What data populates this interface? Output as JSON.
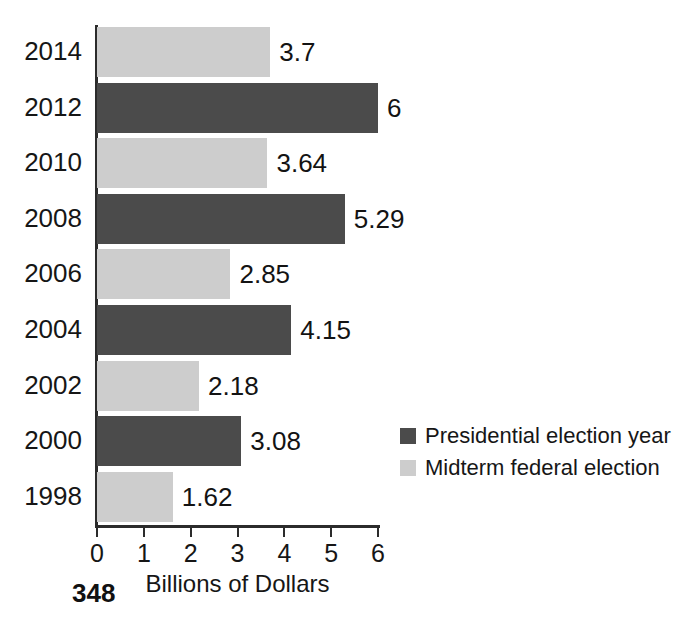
{
  "page": {
    "page_number": "348",
    "background_color": "#ffffff"
  },
  "colors": {
    "presidential": "#4b4b4b",
    "midterm": "#cdcdcd",
    "axis": "#2b2b2b",
    "text": "#161616"
  },
  "legend": {
    "position": "right-middle",
    "entries": [
      {
        "label": "Presidential election year",
        "color": "#4b4b4b",
        "swatch": "presidential"
      },
      {
        "label": "Midterm federal election",
        "color": "#cdcdcd",
        "swatch": "midterm"
      }
    ]
  },
  "axis": {
    "x_title": "Billions of Dollars",
    "x_ticks": [
      "0",
      "1",
      "2",
      "3",
      "4",
      "5",
      "6"
    ]
  },
  "chart_data": {
    "type": "bar",
    "orientation": "horizontal",
    "title": "",
    "subtitle": "",
    "xlabel": "Billions of Dollars",
    "ylabel": "",
    "xlim": [
      0,
      6
    ],
    "xticks": [
      0,
      1,
      2,
      3,
      4,
      5,
      6
    ],
    "grid": false,
    "legend_position": "right",
    "categories": [
      "2014",
      "2012",
      "2010",
      "2008",
      "2006",
      "2004",
      "2002",
      "2000",
      "1998"
    ],
    "values": [
      3.7,
      6,
      3.64,
      5.29,
      2.85,
      4.15,
      2.18,
      3.08,
      1.62
    ],
    "value_labels": [
      "3.7",
      "6",
      "3.64",
      "5.29",
      "2.85",
      "4.15",
      "2.18",
      "3.08",
      "1.62"
    ],
    "groups": [
      "midterm",
      "presidential",
      "midterm",
      "presidential",
      "midterm",
      "presidential",
      "midterm",
      "presidential",
      "midterm"
    ],
    "series": [
      {
        "name": "Presidential election year",
        "color": "#4b4b4b",
        "points": [
          {
            "category": "2012",
            "value": 6
          },
          {
            "category": "2008",
            "value": 5.29
          },
          {
            "category": "2004",
            "value": 4.15
          },
          {
            "category": "2000",
            "value": 3.08
          }
        ]
      },
      {
        "name": "Midterm federal election",
        "color": "#cdcdcd",
        "points": [
          {
            "category": "2014",
            "value": 3.7
          },
          {
            "category": "2010",
            "value": 3.64
          },
          {
            "category": "2006",
            "value": 2.85
          },
          {
            "category": "2002",
            "value": 2.18
          },
          {
            "category": "1998",
            "value": 1.62
          }
        ]
      }
    ]
  }
}
